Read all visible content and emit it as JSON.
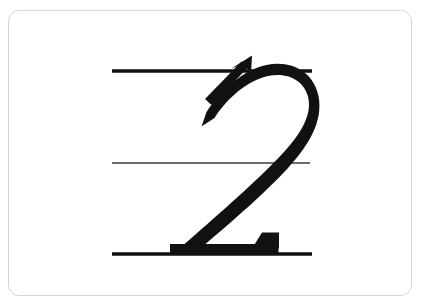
{
  "card": {
    "background_color": "#ffffff",
    "border_color": "#d5d5d5",
    "corner_radius_px": 11,
    "left_px": 8,
    "top_px": 10,
    "width_px": 404,
    "height_px": 286
  },
  "canvas": {
    "width_px": 421,
    "height_px": 306,
    "background_color": "#ffffff"
  },
  "lesson": {
    "character": "2",
    "character_name": "numeral-two",
    "character_type": "digit",
    "stroke_count": 1,
    "script_style": "handwriting-practice",
    "ink_color": "#111111"
  },
  "guide_lines": {
    "count": 3,
    "color_bold": "#111111",
    "color_thin": "#3a3a3a",
    "items": [
      {
        "name": "top-guide-line",
        "role": "ascender-line",
        "y_px": 71,
        "x_start_px": 112,
        "x_end_px": 312,
        "thickness_px": 3.4,
        "weight": "bold"
      },
      {
        "name": "middle-guide-line",
        "role": "midline",
        "y_px": 163,
        "x_start_px": 112,
        "x_end_px": 310,
        "thickness_px": 1.4,
        "weight": "thin"
      },
      {
        "name": "bottom-guide-line",
        "role": "baseline",
        "y_px": 254,
        "x_start_px": 112,
        "x_end_px": 312,
        "thickness_px": 3.4,
        "weight": "bold"
      }
    ]
  },
  "stroke_arrow": {
    "name": "stroke-direction-arrow",
    "direction": "up-right",
    "tail_x_px": 206,
    "tail_y_px": 99,
    "tip_x_px": 250,
    "tip_y_px": 57,
    "color": "#111111"
  },
  "glyph_paths": {
    "stroke_body": "M 201.5 126.5 L 214.5 118.0 C 228.0 97.0 248.0 80.5 268.0 76.0 C 288.5 71.5 304.0 81.0 308.0 96.5 C 312.5 114.5 301.0 133.5 284.0 152.0 C 262.0 176.0 228.0 206.0 196.0 234.0 L 184.0 244.5 L 205.0 244.5 C 232.0 221.5 266.0 192.0 288.0 168.0 C 308.0 146.0 323.5 122.0 318.5 96.0 C 313.5 71.5 291.0 60.0 266.5 65.0 C 243.0 70.0 221.5 89.5 206.5 112.0 Z",
    "base_bar": "M 170.0 245.0 L 277.5 245.0 L 277.5 254.5 L 170.0 254.5 Z",
    "base_bar_taper": "M 268.0 233.5 L 278.5 233.5 L 278.5 247.0 L 258.0 247.0 Z",
    "arrow_shaft": "M 206.0 99.5 L 243.0 62.5 L 248.5 67.5 L 211.0 104.5 Z",
    "arrow_head": "M 251.5 56.0 L 252.5 72.0 L 245.0 64.5 L 234.0 68.5 Z"
  }
}
